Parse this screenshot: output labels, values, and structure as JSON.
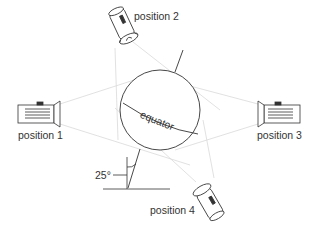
{
  "diagram": {
    "globe": {
      "label": "equator",
      "axis_tilt_label": "25°"
    },
    "positions": [
      {
        "id": 1,
        "label": "position 1"
      },
      {
        "id": 2,
        "label": "position 2"
      },
      {
        "id": 3,
        "label": "position 3"
      },
      {
        "id": 4,
        "label": "position 4"
      }
    ],
    "colors": {
      "line": "#333333",
      "beam": "#d8d8d8",
      "text": "#333333"
    }
  }
}
